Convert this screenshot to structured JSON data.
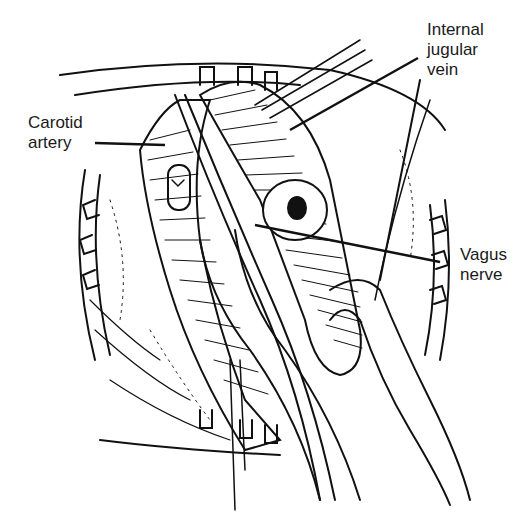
{
  "labels": {
    "carotid": [
      "Carotid",
      "artery"
    ],
    "jugular": [
      "Internal",
      "jugular",
      "vein"
    ],
    "vagus": [
      "Vagus",
      "nerve"
    ]
  },
  "colors": {
    "ink": "#111111",
    "background": "#ffffff"
  }
}
